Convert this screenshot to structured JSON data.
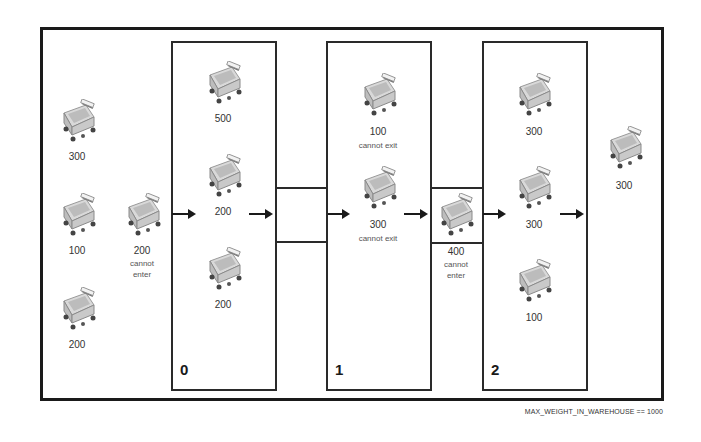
{
  "diagram": {
    "caption": "MAX_WEIGHT_IN_WAREHOUSE == 1000",
    "stages": [
      {
        "id": "0",
        "label": "0"
      },
      {
        "id": "1",
        "label": "1"
      },
      {
        "id": "2",
        "label": "2"
      }
    ],
    "queue": [
      {
        "weight": "300"
      },
      {
        "weight": "100"
      },
      {
        "weight": "200"
      },
      {
        "weight": "200",
        "note_line1": "cannot",
        "note_line2": "enter"
      }
    ],
    "stage0": [
      {
        "weight": "500"
      },
      {
        "weight": "200"
      },
      {
        "weight": "200"
      }
    ],
    "stage1": [
      {
        "weight": "100",
        "note": "cannot exit"
      },
      {
        "weight": "300",
        "note": "cannot exit"
      }
    ],
    "transit_1_2": {
      "weight": "400",
      "note_line1": "cannot",
      "note_line2": "enter"
    },
    "stage2": [
      {
        "weight": "300"
      },
      {
        "weight": "300"
      },
      {
        "weight": "100"
      }
    ],
    "exited": [
      {
        "weight": "300"
      }
    ],
    "icon": "shopping-cart-icon"
  }
}
